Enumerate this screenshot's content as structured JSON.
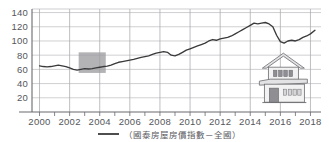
{
  "chart_data": {
    "type": "line",
    "title": "",
    "subtitle": "",
    "xlabel": "",
    "ylabel": "",
    "xlim": [
      1999.5,
      2018.7
    ],
    "ylim": [
      0,
      145
    ],
    "grid": true,
    "legend_position": "bottom-center",
    "y_ticks": [
      20,
      40,
      60,
      80,
      100,
      120,
      140
    ],
    "x_ticks": [
      2000,
      2002,
      2004,
      2006,
      2008,
      2010,
      2012,
      2014,
      2016,
      2018
    ],
    "x_minor_step": 1,
    "series": [
      {
        "name": "（國泰房屋房價指數－全國）",
        "color": "#3a3a3c",
        "x": [
          2000.0,
          2000.25,
          2000.5,
          2000.75,
          2001.0,
          2001.25,
          2001.5,
          2001.75,
          2002.0,
          2002.25,
          2002.5,
          2002.75,
          2003.0,
          2003.25,
          2003.5,
          2003.75,
          2004.0,
          2004.25,
          2004.5,
          2004.75,
          2005.0,
          2005.25,
          2005.5,
          2005.75,
          2006.0,
          2006.25,
          2006.5,
          2006.75,
          2007.0,
          2007.25,
          2007.5,
          2007.75,
          2008.0,
          2008.25,
          2008.5,
          2008.75,
          2009.0,
          2009.25,
          2009.5,
          2009.75,
          2010.0,
          2010.25,
          2010.5,
          2010.75,
          2011.0,
          2011.25,
          2011.5,
          2011.75,
          2012.0,
          2012.25,
          2012.5,
          2012.75,
          2013.0,
          2013.25,
          2013.5,
          2013.75,
          2014.0,
          2014.25,
          2014.5,
          2014.75,
          2015.0,
          2015.25,
          2015.5,
          2015.75,
          2016.0,
          2016.25,
          2016.5,
          2016.75,
          2017.0,
          2017.25,
          2017.5,
          2017.75,
          2018.0,
          2018.3
        ],
        "values": [
          65,
          64,
          63.5,
          64,
          65,
          66,
          65,
          64,
          62,
          60,
          59,
          60,
          61,
          60.5,
          61,
          62,
          63,
          64,
          64.5,
          66,
          68,
          70,
          71,
          72,
          73,
          74,
          75.5,
          77,
          78,
          79,
          81,
          83,
          84,
          85,
          84,
          80,
          79,
          81,
          84,
          87,
          89,
          91,
          93,
          95,
          97,
          100,
          102,
          101,
          103,
          104,
          105,
          107,
          110,
          113,
          116,
          119,
          122,
          125,
          124,
          125,
          126,
          124,
          120,
          108,
          99,
          97,
          100,
          101,
          100,
          102,
          105,
          107,
          110,
          115
        ]
      }
    ],
    "highlight_region": {
      "x_start": 2002.6,
      "x_end": 2004.4,
      "y_start": 55,
      "y_end": 84,
      "color": "#9d9da1"
    },
    "annotations": [
      {
        "name": "house-illustration",
        "x_center": 2016.2,
        "y_center": 42
      }
    ]
  },
  "legend": {
    "label": "（國泰房屋房價指數－全國）",
    "marker_color": "#3a3a3c"
  },
  "axis": {
    "y_tick_labels": [
      "140",
      "120",
      "100",
      "80",
      "60",
      "40",
      "20"
    ],
    "x_tick_labels": [
      "2000",
      "2002",
      "2004",
      "2006",
      "2008",
      "2010",
      "2012",
      "2014",
      "2016",
      "2018"
    ],
    "grid_color": "#a9a9ad",
    "axis_color": "#6a6a6e",
    "label_color": "#55565a"
  },
  "icons": {
    "house": "house-icon"
  }
}
